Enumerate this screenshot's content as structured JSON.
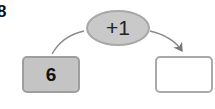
{
  "question_number": "8",
  "operation": {
    "label": "+1",
    "fill_color": "#c9c9c9"
  },
  "input_box": {
    "value": "6",
    "fill_color": "#c4c4c4"
  },
  "output_box": {
    "value": "",
    "fill_color": "#ffffff"
  }
}
